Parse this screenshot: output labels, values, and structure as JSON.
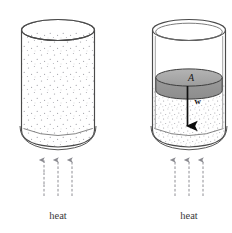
{
  "figure": {
    "title": "",
    "panels": [
      {
        "id": "left-panel",
        "name": "open-cylinder-constant-volume",
        "caption": "heat",
        "cylinder": {
          "name": "cylinder-open",
          "fill_label": "gas",
          "stipple": "sparse"
        },
        "arrows": {
          "name": "heat-arrows",
          "count": 3,
          "direction": "up",
          "style": "wavy"
        }
      },
      {
        "id": "right-panel",
        "name": "piston-cylinder-constant-pressure",
        "caption": "heat",
        "cylinder": {
          "name": "cylinder-with-piston",
          "fill_label": "gas",
          "stipple": "dense"
        },
        "piston": {
          "name": "piston-disk",
          "area_label": "A",
          "weight_label": "w",
          "weight_direction": "down",
          "color": "#a8a8a8"
        },
        "arrows": {
          "name": "heat-arrows",
          "count": 3,
          "direction": "up",
          "style": "wavy"
        }
      }
    ],
    "colors": {
      "outline": "#4a4a4a",
      "stipple": "#9a9aa0",
      "piston_fill": "#a9a9a9",
      "piston_edge": "#3d3d3d",
      "arrow": "#8e8e94",
      "weight_arrow": "#101010",
      "caption": "#3a3a3a",
      "background": "#ffffff"
    }
  }
}
